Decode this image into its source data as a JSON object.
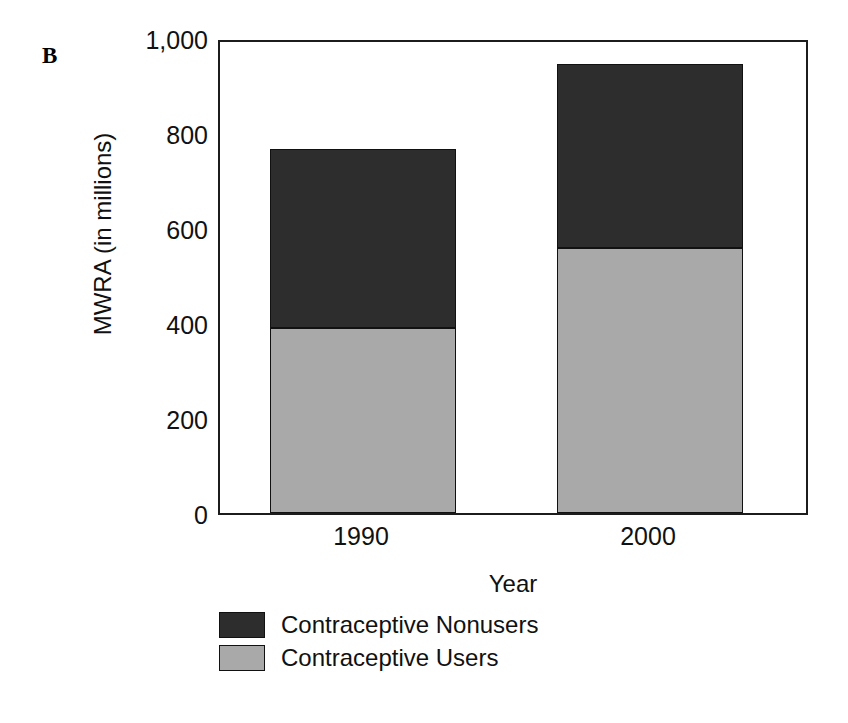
{
  "figure": {
    "panel_label": "B"
  },
  "chart_data": {
    "type": "bar",
    "stacked": true,
    "title": "",
    "xlabel": "Year",
    "ylabel": "MWRA (in millions)",
    "categories": [
      "1990",
      "2000"
    ],
    "series": [
      {
        "name": "Contraceptive Nonusers",
        "values": [
          377,
          387
        ],
        "color": "#2d2d2d"
      },
      {
        "name": "Contraceptive Users",
        "values": [
          389,
          558
        ],
        "color": "#a9a9a9"
      }
    ],
    "totals": [
      766,
      945
    ],
    "ylim": [
      0,
      1000
    ],
    "yticks": [
      0,
      200,
      400,
      600,
      800,
      1000
    ],
    "ytick_labels": [
      "0",
      "200",
      "400",
      "600",
      "800",
      "1,000"
    ],
    "grid": false,
    "legend_position": "below-left",
    "stack_order_bottom_to_top": [
      "Contraceptive Users",
      "Contraceptive Nonusers"
    ]
  },
  "axes": {
    "y_ticks": [
      {
        "label": "1,000",
        "value": 1000
      },
      {
        "label": "800",
        "value": 800
      },
      {
        "label": "600",
        "value": 600
      },
      {
        "label": "400",
        "value": 400
      },
      {
        "label": "200",
        "value": 200
      },
      {
        "label": "0",
        "value": 0
      }
    ],
    "y_title": "MWRA (in millions)",
    "x_ticks": [
      {
        "label": "1990"
      },
      {
        "label": "2000"
      }
    ],
    "x_title": "Year"
  },
  "legend": {
    "items": [
      {
        "label": "Contraceptive Nonusers",
        "color": "#2d2d2d"
      },
      {
        "label": "Contraceptive Users",
        "color": "#a9a9a9"
      }
    ]
  }
}
